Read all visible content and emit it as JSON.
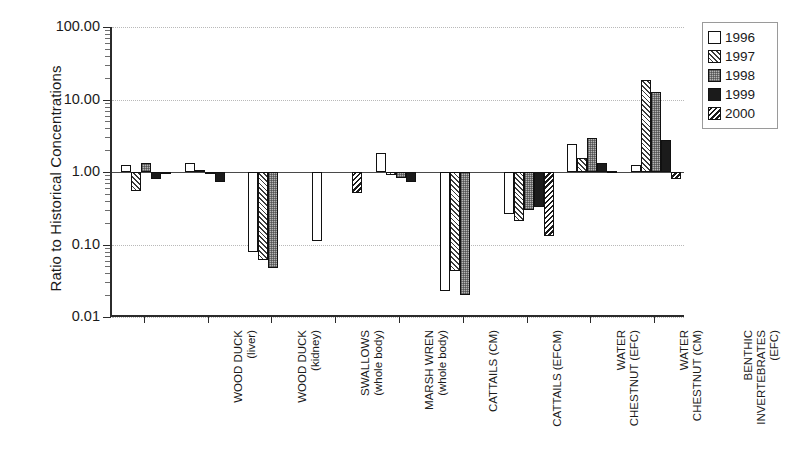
{
  "chart_data": {
    "type": "bar",
    "title": "",
    "subtitle": "",
    "xlabel": "",
    "ylabel": "Ratio to Historical Concentrations",
    "yscale": "log",
    "ylim": [
      0.01,
      100.0
    ],
    "ytick_labels": [
      "100.00",
      "10.00",
      "1.00",
      "0.10",
      "0.01"
    ],
    "ytick_values": [
      100.0,
      10.0,
      1.0,
      0.1,
      0.01
    ],
    "grid": true,
    "reference_line": 1.0,
    "legend_position": "top-right",
    "legend_entries": [
      "1996",
      "1997",
      "1998",
      "1999",
      "2000"
    ],
    "categories": [
      "WOOD DUCK (liver)",
      "WOOD DUCK (kidney)",
      "SWALLOWS (whole body)",
      "MARSH WREN (whole body)",
      "CATTAILS (CM)",
      "CATTAILS (EFCM)",
      "WATER CHESTNUT (EFC)",
      "WATER CHESTNUT (CM)",
      "BENTHIC INVERTEBRATES (EFC)"
    ],
    "category_lines": [
      [
        "WOOD DUCK",
        "(liver)"
      ],
      [
        "WOOD DUCK",
        "(kidney)"
      ],
      [
        "SWALLOWS",
        "(whole body)"
      ],
      [
        "MARSH WREN",
        "(whole body)"
      ],
      [
        "CATTAILS (CM)",
        ""
      ],
      [
        "CATTAILS (EFCM)",
        ""
      ],
      [
        "WATER",
        "CHESTNUT (EFC)"
      ],
      [
        "WATER",
        "CHESTNUT (CM)"
      ],
      [
        "BENTHIC",
        "INVERTEBRATES",
        "(EFC)"
      ]
    ],
    "series": [
      {
        "name": "1996",
        "values": [
          1.25,
          1.35,
          0.078,
          0.11,
          1.85,
          0.023,
          0.26,
          2.4,
          1.25
        ]
      },
      {
        "name": "1997",
        "values": [
          0.55,
          1.08,
          0.062,
          null,
          0.92,
          0.043,
          0.21,
          1.55,
          18.5
        ]
      },
      {
        "name": "1998",
        "values": [
          1.35,
          1.0,
          0.048,
          null,
          0.82,
          0.02,
          0.3,
          2.9,
          12.5
        ]
      },
      {
        "name": "1999",
        "values": [
          0.8,
          0.73,
          null,
          null,
          0.73,
          null,
          0.33,
          1.35,
          2.8
        ]
      },
      {
        "name": "2000",
        "values": [
          0.95,
          null,
          null,
          0.52,
          null,
          null,
          0.13,
          1.03,
          0.8
        ]
      }
    ]
  }
}
